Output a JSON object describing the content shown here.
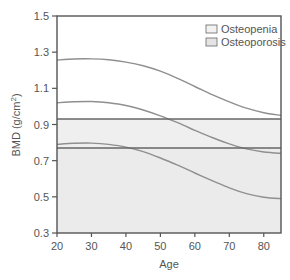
{
  "chart_data": {
    "type": "line",
    "title": "",
    "xlabel": "Age",
    "ylabel": "BMD (g/cm²)",
    "ylabel_parts": {
      "main": "BMD (g/cm",
      "sup": "2",
      "end": ")"
    },
    "xlim": [
      20,
      85
    ],
    "ylim": [
      0.3,
      1.5
    ],
    "x_ticks": [
      20,
      30,
      40,
      50,
      60,
      70,
      80
    ],
    "y_ticks": [
      0.3,
      0.5,
      0.7,
      0.9,
      1.1,
      1.3,
      1.5
    ],
    "y_tick_labels": [
      "0.3",
      "0.5",
      "0.7",
      "0.9",
      "1.1",
      "1.3",
      "1.5"
    ],
    "grid": false,
    "legend_position": "upper right",
    "thresholds": [
      {
        "name": "Osteopenia",
        "value": 0.93,
        "fill": "#efefef",
        "swatch": "#f2f2f2"
      },
      {
        "name": "Osteoporosis",
        "value": 0.77,
        "fill": "#ebebeb",
        "swatch": "#e4e4e4"
      }
    ],
    "legend": [
      {
        "label": "Osteopenia",
        "swatch": "#f2f2f2"
      },
      {
        "label": "Osteoporosis",
        "swatch": "#e4e4e4"
      }
    ],
    "x": [
      20,
      25,
      30,
      35,
      40,
      45,
      50,
      55,
      60,
      65,
      70,
      75,
      80,
      85
    ],
    "series": [
      {
        "name": "Upper curve",
        "color": "#8f8f8f",
        "values": [
          1.256,
          1.262,
          1.263,
          1.258,
          1.245,
          1.225,
          1.195,
          1.155,
          1.11,
          1.065,
          1.025,
          0.99,
          0.965,
          0.95
        ]
      },
      {
        "name": "Middle curve",
        "color": "#8f8f8f",
        "values": [
          1.02,
          1.026,
          1.027,
          1.02,
          1.005,
          0.98,
          0.948,
          0.91,
          0.868,
          0.828,
          0.793,
          0.765,
          0.748,
          0.74
        ]
      },
      {
        "name": "Lower curve",
        "color": "#8f8f8f",
        "values": [
          0.79,
          0.796,
          0.797,
          0.79,
          0.775,
          0.75,
          0.715,
          0.675,
          0.632,
          0.59,
          0.55,
          0.518,
          0.498,
          0.49
        ]
      }
    ]
  }
}
